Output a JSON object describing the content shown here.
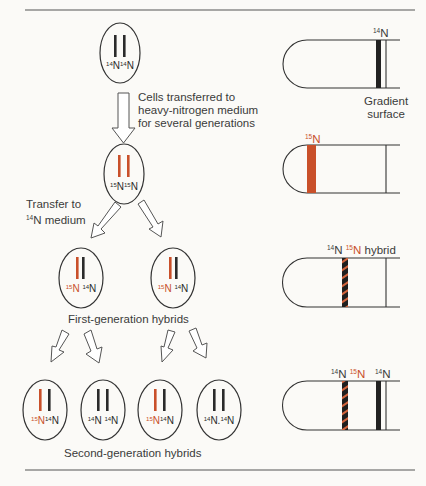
{
  "colors": {
    "light_dna": "#2b2b2b",
    "heavy_dna": "#c9502a",
    "outline": "#3a3a3a",
    "background": "#fbfaf7"
  },
  "captions": {
    "transfer_heavy_line1": "Cells transferred to",
    "transfer_heavy_line2": "heavy-nitrogen medium",
    "transfer_heavy_line3": "for several generations",
    "transfer_light_line1": "Transfer to",
    "transfer_light_line2_iso": "14",
    "transfer_light_line2_rest": "N medium",
    "first_gen": "First-generation hybrids",
    "second_gen": "Second-generation hybrids"
  },
  "cells": {
    "parent": {
      "iso1": "14",
      "el1": "N",
      "iso2": "14",
      "el2": "N"
    },
    "heavy": {
      "iso1": "15",
      "el1": "N",
      "iso2": "15",
      "el2": "N"
    },
    "gen1_left": {
      "iso1": "15",
      "el1": "N",
      "iso2": "14",
      "el2": "N"
    },
    "gen1_right": {
      "iso1": "15",
      "el1": "N",
      "iso2": "14",
      "el2": "N"
    },
    "gen2_a": {
      "iso1": "15",
      "el1": "N",
      "iso2": "14",
      "el2": "N"
    },
    "gen2_b": {
      "iso1": "14",
      "el1": "N",
      "iso2": "14",
      "el2": "N"
    },
    "gen2_c": {
      "iso1": "15",
      "el1": "N",
      "iso2": "14",
      "el2": "N"
    },
    "gen2_d": {
      "iso1": "14",
      "el1": "N",
      "iso2": "14",
      "el2": "N"
    }
  },
  "tubes": {
    "tube1": {
      "label_iso": "14",
      "label_el": "N",
      "caption_line1": "Gradient",
      "caption_line2": "surface"
    },
    "tube2": {
      "label_iso": "15",
      "label_el": "N"
    },
    "tube3": {
      "label1_iso": "14",
      "label1_el": "N",
      "label2_iso": "15",
      "label2_el": "N",
      "label_suffix": "hybrid"
    },
    "tube4": {
      "label1_iso": "14",
      "label1_el": "N",
      "label2_iso": "15",
      "label2_el": "N",
      "label3_iso": "14",
      "label3_el": "N"
    }
  }
}
